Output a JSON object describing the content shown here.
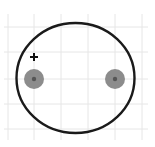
{
  "diagram": {
    "type": "pcb-footprint",
    "component": "polarized-capacitor",
    "polarity_mark": "+",
    "colors": {
      "background": "#ffffff",
      "grid": "#e6e6e6",
      "outline": "#1a1a1a",
      "pad": "#8c8c8c",
      "pad_center": "#555555",
      "polarity": "#111111"
    },
    "grid": {
      "x_lines": [
        8,
        34,
        61,
        88,
        115,
        142
      ],
      "y_lines": [
        27,
        52,
        79,
        104,
        129
      ]
    },
    "outline": {
      "cx": 75.5,
      "cy": 78,
      "rx": 59,
      "ry": 55
    },
    "pads": [
      {
        "name": "pad-positive",
        "cx": 34,
        "cy": 79,
        "r": 10
      },
      {
        "name": "pad-negative",
        "cx": 115,
        "cy": 79,
        "r": 10
      }
    ],
    "plus": {
      "x": 34,
      "y": 57,
      "size": 8
    }
  }
}
